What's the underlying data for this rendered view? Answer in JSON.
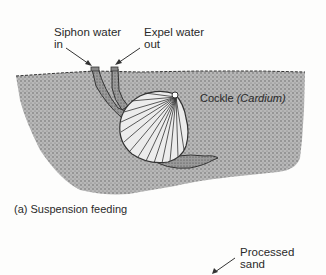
{
  "labels": {
    "siphon_in": "Siphon water\nin",
    "expel_out": "Expel water\nout",
    "organism_name": "Cockle ",
    "organism_genus": "(Cardium)",
    "caption": "(a) Suspension feeding",
    "processed_sand": "Processed\nsand"
  },
  "colors": {
    "sediment": "#b3b3b3",
    "sediment_dots": "#555555",
    "shell": "#e6e6e6",
    "outline": "#333333",
    "background": "#fdfdfc"
  }
}
